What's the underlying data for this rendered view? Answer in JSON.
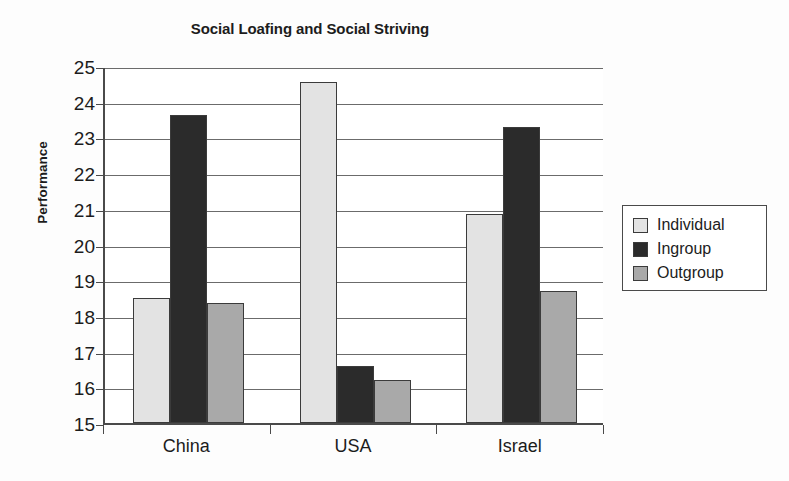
{
  "chart_data": {
    "type": "bar",
    "title": "Social Loafing and Social Striving",
    "xlabel": "",
    "ylabel": "Performance",
    "categories": [
      "China",
      "USA",
      "Israel"
    ],
    "series": [
      {
        "name": "Individual",
        "color": "#e3e3e3",
        "values": [
          18.5,
          24.55,
          20.85
        ]
      },
      {
        "name": "Ingroup",
        "color": "#2b2b2b",
        "values": [
          23.63,
          16.6,
          23.28
        ]
      },
      {
        "name": "Outgroup",
        "color": "#a9a9a9",
        "values": [
          18.35,
          16.2,
          18.7
        ]
      }
    ],
    "ylim": [
      15,
      25
    ],
    "yticks": [
      25,
      24,
      23,
      22,
      21,
      20,
      19,
      18,
      17,
      16,
      15
    ],
    "grid": true,
    "legend_position": "right"
  }
}
